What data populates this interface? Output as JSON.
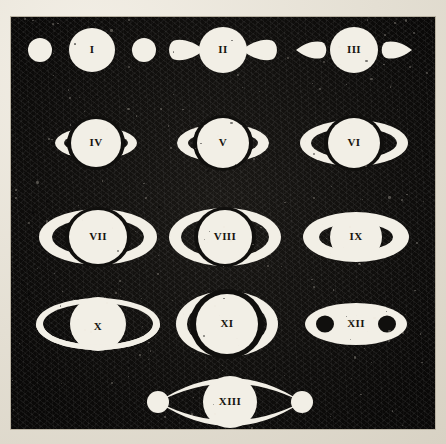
{
  "plate": {
    "title": "Systema Saturnium ring-phase plate",
    "description": "Engraved plate of thirteen numbered telescopic appearances of Saturn",
    "background_color": "#e8e3d9",
    "plate_ink_color": "#100f0d",
    "figure_color": "#f2efe6",
    "label_color": "#17150f",
    "frame_border_color": "#b9b2a2",
    "plate_rect": {
      "x": 10,
      "y": 16,
      "width": 426,
      "height": 414
    }
  },
  "figures": [
    {
      "label": "I",
      "kind": "globe-with-detached-round-ansae",
      "row": 1,
      "cx": 91,
      "cy": 49,
      "globe_rx": 23,
      "globe_ry": 22,
      "ansa_rx": 12,
      "ansa_ry": 12,
      "ansa_offset": 52,
      "label_dx": 0,
      "label_dy": 0,
      "font_size": 11
    },
    {
      "label": "II",
      "kind": "globe-with-attached-teardrop-ansae-inward",
      "row": 1,
      "cx": 222,
      "cy": 49,
      "globe_rx": 24,
      "globe_ry": 23,
      "ansa_len": 30,
      "ansa_half": 12,
      "label_dx": 0,
      "label_dy": 0,
      "font_size": 11
    },
    {
      "label": "III",
      "kind": "globe-with-detached-teardrop-ansae-outward",
      "row": 1,
      "cx": 353,
      "cy": 49,
      "globe_rx": 24,
      "globe_ry": 23,
      "ansa_len": 26,
      "ansa_half": 10,
      "ansa_gap": 8,
      "label_dx": 0,
      "label_dy": 0,
      "font_size": 11
    },
    {
      "label": "IV",
      "kind": "globe-with-small-crescent-ansae",
      "row": 2,
      "cx": 95,
      "cy": 142,
      "globe_rx": 25,
      "globe_ry": 24,
      "ring_rx": 41,
      "ring_ry": 16,
      "ring_thick": 9,
      "label_dx": 0,
      "label_dy": 0,
      "font_size": 11
    },
    {
      "label": "V",
      "kind": "globe-with-crescent-ansae",
      "row": 2,
      "cx": 222,
      "cy": 142,
      "globe_rx": 26,
      "globe_ry": 25,
      "ring_rx": 46,
      "ring_ry": 19,
      "ring_thick": 11,
      "label_dx": 0,
      "label_dy": 0,
      "font_size": 11
    },
    {
      "label": "VI",
      "kind": "globe-with-open-ring-arcs",
      "row": 2,
      "cx": 353,
      "cy": 142,
      "globe_rx": 26,
      "globe_ry": 25,
      "ring_rx": 54,
      "ring_ry": 23,
      "ring_thick": 11,
      "label_dx": 0,
      "label_dy": 0,
      "font_size": 11
    },
    {
      "label": "VII",
      "kind": "globe-with-open-ring-arcs",
      "row": 3,
      "cx": 97,
      "cy": 236,
      "globe_rx": 29,
      "globe_ry": 27,
      "ring_rx": 59,
      "ring_ry": 28,
      "ring_thick": 13,
      "label_dx": 0,
      "label_dy": 0,
      "font_size": 11
    },
    {
      "label": "VIII",
      "kind": "globe-with-open-ring-arcs",
      "row": 3,
      "cx": 224,
      "cy": 236,
      "globe_rx": 27,
      "globe_ry": 27,
      "ring_rx": 56,
      "ring_ry": 29,
      "ring_thick": 12,
      "label_dx": 0,
      "label_dy": 0,
      "font_size": 11
    },
    {
      "label": "IX",
      "kind": "globe-over-open-ring",
      "row": 3,
      "cx": 355,
      "cy": 236,
      "globe_rx": 26,
      "globe_ry": 24,
      "ring_rx": 53,
      "ring_ry": 25,
      "ring_thick": 16,
      "label_dx": 0,
      "label_dy": 0,
      "font_size": 11
    },
    {
      "label": "X",
      "kind": "globe-with-thin-full-ring",
      "row": 4,
      "cx": 97,
      "cy": 323,
      "globe_rx": 28,
      "globe_ry": 27,
      "ring_rx": 62,
      "ring_ry": 26,
      "ring_thick": 7,
      "label_dx": 0,
      "label_dy": 3,
      "font_size": 11
    },
    {
      "label": "XI",
      "kind": "globe-with-embracing-ring-arcs",
      "row": 4,
      "cx": 226,
      "cy": 323,
      "globe_rx": 31,
      "globe_ry": 30,
      "ring_rx": 51,
      "ring_ry": 33,
      "ring_thick": 11,
      "label_dx": 0,
      "label_dy": 0,
      "font_size": 11
    },
    {
      "label": "XII",
      "kind": "filled-ellipse-with-two-dark-dots",
      "row": 4,
      "cx": 355,
      "cy": 323,
      "ellipse_rx": 51,
      "ellipse_ry": 21,
      "dot_r": 9,
      "dot_offset": 31,
      "label_dx": 0,
      "label_dy": 0,
      "font_size": 11
    },
    {
      "label": "XIII",
      "kind": "globe-with-lens-ring-outline-and-knobs",
      "row": 5,
      "cx": 229,
      "cy": 401,
      "globe_rx": 27,
      "globe_ry": 26,
      "ring_rx": 72,
      "ring_ry": 24,
      "ring_thick": 5,
      "knob_r": 11,
      "label_dx": 0,
      "label_dy": 0,
      "font_size": 11
    }
  ],
  "plate_seams": [
    {
      "y": 192,
      "opacity": 0.1
    },
    {
      "y": 428,
      "opacity": 0.07
    }
  ]
}
